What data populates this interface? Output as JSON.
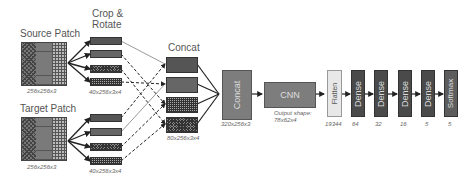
{
  "inputs": {
    "source": {
      "label": "Source Patch",
      "dim": "256x256x3"
    },
    "target": {
      "label": "Target Patch",
      "dim": "256x256x3"
    }
  },
  "crop": {
    "label_line1": "Crop &",
    "label_line2": "Rotate",
    "dim_top": "40x256x3x4",
    "dim_bottom": "40x256x3x4"
  },
  "concat1": {
    "label": "Concat",
    "dim": "80x256x3x4"
  },
  "concat2": {
    "label": "Concat",
    "dim": "320x256x3"
  },
  "cnn": {
    "label": "CNN",
    "output_line1": "Output shape:",
    "output_line2": "78x62x4"
  },
  "flatten": {
    "label": "Flatten",
    "size": "19344"
  },
  "dense_layers": [
    {
      "label": "Dense",
      "size": "64"
    },
    {
      "label": "Dense",
      "size": "32"
    },
    {
      "label": "Dense",
      "size": "16"
    },
    {
      "label": "Dense",
      "size": "5"
    }
  ],
  "softmax": {
    "label": "Softmax",
    "size": "5"
  },
  "colors": {
    "block": "#7d7d7d",
    "dense": "#4a4a4a",
    "flatten": "#e8e8e8",
    "softmax": "#5d5d5d",
    "line": "#333333"
  }
}
